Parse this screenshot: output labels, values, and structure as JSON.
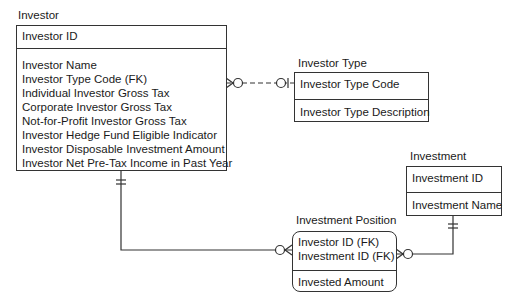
{
  "entities": {
    "investor": {
      "title": "Investor",
      "key": [
        "Investor ID"
      ],
      "attributes": [
        "Investor Name",
        "Investor Type Code (FK)",
        "Individual Investor Gross Tax",
        "Corporate Investor Gross Tax",
        "Not-for-Profit Investor Gross Tax",
        "Investor Hedge Fund Eligible Indicator",
        "Investor Disposable Investment Amount",
        "Investor Net Pre-Tax Income in Past Year"
      ]
    },
    "investor_type": {
      "title": "Investor Type",
      "key": [
        "Investor Type Code"
      ],
      "attributes": [
        "Investor Type Description"
      ]
    },
    "investment": {
      "title": "Investment",
      "key": [
        "Investment ID"
      ],
      "attributes": [
        "Investment Name"
      ]
    },
    "investment_position": {
      "title": "Investment Position",
      "key": [
        "Investor ID (FK)",
        "Investment ID (FK)"
      ],
      "attributes": [
        "Invested Amount"
      ]
    }
  },
  "relationships": [
    {
      "from": "Investor Type",
      "to": "Investor",
      "style": "dashed",
      "from_cardinality": "zero-or-one",
      "to_cardinality": "zero-or-many"
    },
    {
      "from": "Investor",
      "to": "Investment Position",
      "style": "solid",
      "from_cardinality": "one-and-only-one",
      "to_cardinality": "zero-or-many"
    },
    {
      "from": "Investment",
      "to": "Investment Position",
      "style": "solid",
      "from_cardinality": "one-and-only-one",
      "to_cardinality": "zero-or-many"
    }
  ],
  "colors": {
    "line": "#333333",
    "text": "#1a1a1a",
    "background": "#ffffff"
  }
}
